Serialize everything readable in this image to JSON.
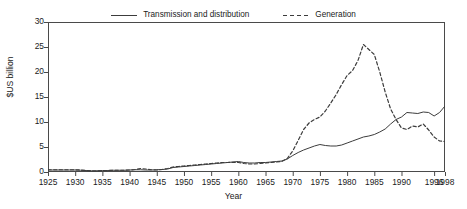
{
  "chart_data": {
    "type": "line",
    "title": "",
    "xlabel": "Year",
    "ylabel": "$US billion",
    "xlim": [
      1925,
      1998
    ],
    "ylim": [
      0,
      30
    ],
    "grid": false,
    "legend_position": "top-center",
    "xticks": [
      1925,
      1930,
      1935,
      1940,
      1945,
      1950,
      1955,
      1960,
      1965,
      1970,
      1975,
      1980,
      1985,
      1990,
      1996,
      1998
    ],
    "xtick_labels": [
      "1925",
      "1930",
      "1935",
      "1940",
      "1945",
      "1950",
      "1955",
      "1960",
      "1965",
      "1970",
      "1975",
      "1980",
      "1985",
      "1990",
      "1996",
      "1998"
    ],
    "yticks": [
      0,
      5,
      10,
      15,
      20,
      25,
      30
    ],
    "ytick_labels": [
      "0",
      "5",
      "10",
      "15",
      "20",
      "25",
      "30"
    ],
    "x": [
      1925,
      1926,
      1927,
      1928,
      1929,
      1930,
      1931,
      1932,
      1933,
      1934,
      1935,
      1936,
      1937,
      1938,
      1939,
      1940,
      1941,
      1942,
      1943,
      1944,
      1945,
      1946,
      1947,
      1948,
      1949,
      1950,
      1951,
      1952,
      1953,
      1954,
      1955,
      1956,
      1957,
      1958,
      1959,
      1960,
      1961,
      1962,
      1963,
      1964,
      1965,
      1966,
      1967,
      1968,
      1969,
      1970,
      1971,
      1972,
      1973,
      1974,
      1975,
      1976,
      1977,
      1978,
      1979,
      1980,
      1981,
      1982,
      1983,
      1984,
      1985,
      1986,
      1987,
      1988,
      1989,
      1990,
      1991,
      1992,
      1993,
      1994,
      1995,
      1996,
      1997,
      1998
    ],
    "series": [
      {
        "name": "Transmission and distribution",
        "style": "solid",
        "color": "#3c3c3c",
        "values": [
          0.4,
          0.4,
          0.4,
          0.4,
          0.4,
          0.4,
          0.35,
          0.3,
          0.25,
          0.25,
          0.3,
          0.3,
          0.35,
          0.35,
          0.35,
          0.4,
          0.45,
          0.45,
          0.4,
          0.4,
          0.45,
          0.5,
          0.6,
          0.9,
          1.0,
          1.1,
          1.2,
          1.3,
          1.4,
          1.5,
          1.6,
          1.7,
          1.8,
          1.9,
          2.0,
          2.1,
          1.9,
          1.8,
          1.8,
          1.9,
          1.9,
          2.0,
          2.1,
          2.2,
          2.6,
          3.3,
          3.9,
          4.4,
          4.8,
          5.2,
          5.5,
          5.3,
          5.2,
          5.2,
          5.4,
          5.8,
          6.2,
          6.6,
          7.0,
          7.2,
          7.5,
          8.0,
          8.6,
          9.6,
          10.5,
          11.0,
          11.9,
          11.8,
          11.7,
          12.0,
          11.9,
          11.2,
          11.9,
          13.2
        ]
      },
      {
        "name": "Generation",
        "style": "dashed",
        "color": "#3c3c3c",
        "values": [
          0.45,
          0.45,
          0.45,
          0.45,
          0.45,
          0.45,
          0.4,
          0.3,
          0.2,
          0.2,
          0.25,
          0.3,
          0.35,
          0.35,
          0.35,
          0.4,
          0.5,
          0.7,
          0.6,
          0.45,
          0.4,
          0.5,
          0.7,
          1.0,
          1.1,
          1.2,
          1.3,
          1.4,
          1.5,
          1.6,
          1.7,
          1.8,
          1.9,
          1.9,
          1.95,
          1.9,
          1.7,
          1.6,
          1.6,
          1.7,
          1.8,
          1.9,
          2.0,
          2.1,
          2.7,
          4.2,
          6.3,
          8.5,
          9.8,
          10.5,
          11.0,
          12.2,
          13.8,
          15.5,
          17.5,
          19.3,
          20.3,
          22.3,
          25.5,
          24.5,
          23.5,
          20.0,
          16.0,
          12.6,
          10.5,
          8.8,
          8.5,
          9.2,
          9.0,
          9.6,
          8.4,
          7.0,
          6.2,
          6.1
        ]
      }
    ]
  },
  "legend": {
    "entries": [
      {
        "label": "Transmission and distribution",
        "style": "solid"
      },
      {
        "label": "Generation",
        "style": "dashed"
      }
    ]
  },
  "axes": {
    "x_title": "Year",
    "y_title": "$US billion"
  },
  "colors": {
    "axis": "#4a4a4a",
    "line": "#3c3c3c",
    "text": "#1a1a1a",
    "background": "#ffffff"
  }
}
